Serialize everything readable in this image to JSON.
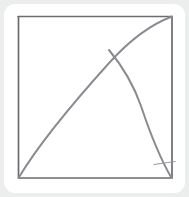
{
  "page": {
    "width": 189,
    "height": 197,
    "background_color": "#eceded"
  },
  "card": {
    "name": "figure-card",
    "background_color": "#ffffff",
    "corner_radius": 11,
    "left": 4,
    "top": 4,
    "width": 181,
    "height": 189
  },
  "figure": {
    "stroke_color": "#6b6b70",
    "stroke_color_light": "#8a8a90",
    "stroke_width": 1.7,
    "square": {
      "name": "square-frame",
      "left": 18,
      "top": 16,
      "right": 172,
      "bottom": 178,
      "width": 154,
      "height": 162,
      "corners": {
        "top_left": [
          18,
          16
        ],
        "top_right": [
          172,
          16
        ],
        "bottom_right": [
          172,
          178
        ],
        "bottom_left": [
          18,
          178
        ]
      },
      "path": "M18,16 L172,16 L172,178 L18,178 Z"
    },
    "arc_rising": {
      "name": "rising-arc",
      "from": [
        18,
        178
      ],
      "to": [
        172,
        16
      ],
      "control_points": [
        [
          60,
          96
        ],
        [
          112,
          44
        ]
      ],
      "path": "M18.5,178 C40,142 72,104 110,62 C130,40 152,24 172,16.5",
      "concavity": "concave-up"
    },
    "curve_descending": {
      "name": "descending-curve",
      "from": [
        110,
        50
      ],
      "to": [
        172,
        178
      ],
      "branch_point": [
        110,
        50
      ],
      "control_points": [
        [
          132,
          80
        ],
        [
          150,
          128
        ]
      ],
      "path": "M109,50 C124,68 134,86 141,106 C149,130 160,158 171.5,178"
    },
    "tick_mark": {
      "name": "tick-mark",
      "from": [
        154,
        164
      ],
      "to": [
        175,
        161
      ],
      "path": "M154,164.5 L175,161.5"
    }
  },
  "chart_data": {
    "type": "line",
    "xlabel": "",
    "ylabel": "",
    "xlim": [
      0,
      1
    ],
    "ylim": [
      0,
      1
    ],
    "grid": false,
    "legend": "none",
    "annotations": [
      "Unit square outline",
      "Concave rising arc corner-to-corner",
      "Descending branch curve to bottom-right corner",
      "Short tick mark near bottom-right corner"
    ],
    "series": [
      {
        "name": "square-frame",
        "x": [
          0,
          1,
          1,
          0,
          0
        ],
        "y": [
          1,
          1,
          0,
          0,
          1
        ]
      },
      {
        "name": "rising-arc",
        "x": [
          0.0,
          0.14,
          0.27,
          0.41,
          0.55,
          0.6,
          0.73,
          0.87,
          1.0
        ],
        "y": [
          0.0,
          0.22,
          0.41,
          0.57,
          0.7,
          0.79,
          0.86,
          0.94,
          1.0
        ]
      },
      {
        "name": "descending-curve",
        "x": [
          0.6,
          0.68,
          0.76,
          0.8,
          0.86,
          0.93,
          1.0
        ],
        "y": [
          0.79,
          0.66,
          0.55,
          0.44,
          0.32,
          0.17,
          0.0
        ]
      }
    ]
  }
}
